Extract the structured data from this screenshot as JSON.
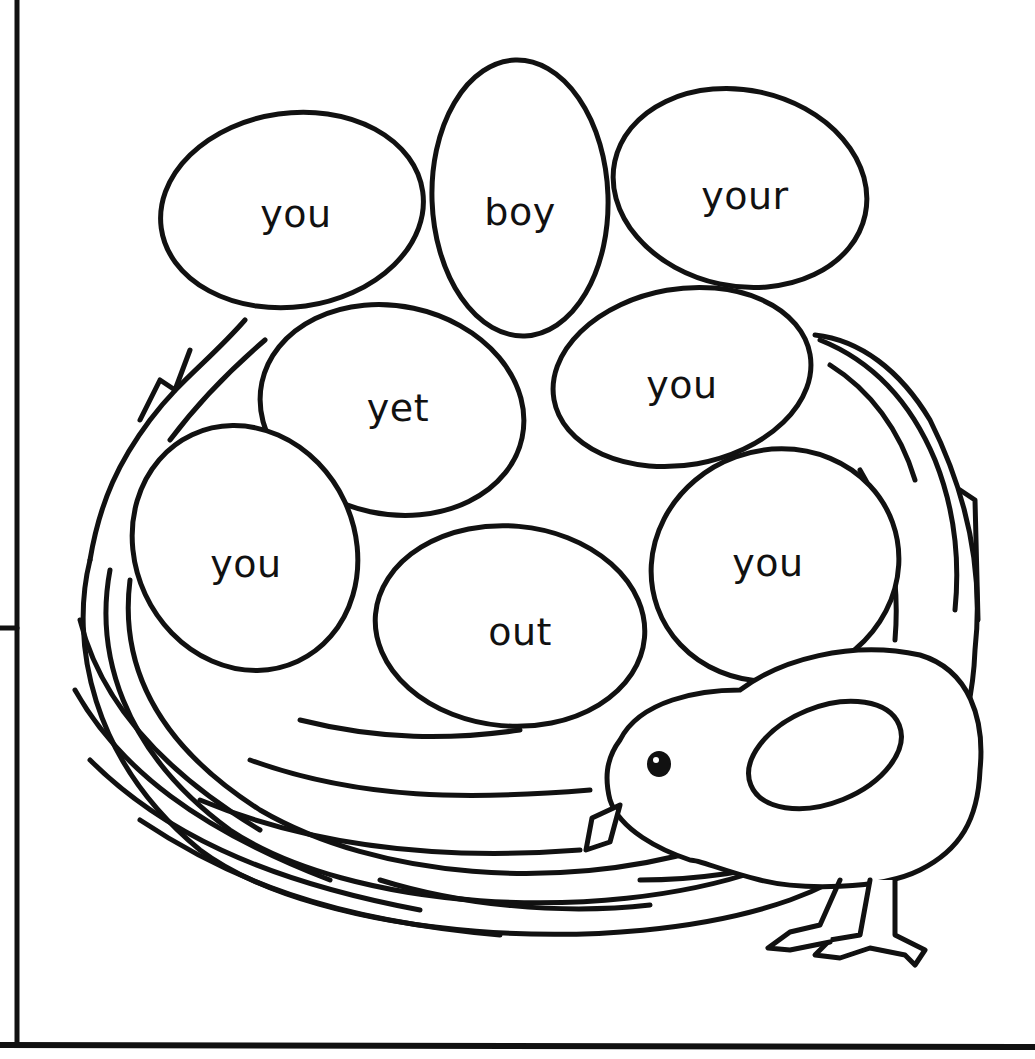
{
  "worksheet": {
    "description": "Coloring worksheet: eggs in a nest with sight words, chick pecking at nest",
    "eggs": [
      {
        "word": "you",
        "cx": 296,
        "cy": 212
      },
      {
        "word": "boy",
        "cx": 520,
        "cy": 212
      },
      {
        "word": "your",
        "cx": 745,
        "cy": 196
      },
      {
        "word": "yet",
        "cx": 398,
        "cy": 408
      },
      {
        "word": "you",
        "cx": 682,
        "cy": 385
      },
      {
        "word": "you",
        "cx": 246,
        "cy": 564
      },
      {
        "word": "out",
        "cx": 520,
        "cy": 632
      },
      {
        "word": "you",
        "cx": 768,
        "cy": 563
      }
    ],
    "colors": {
      "ink": "#111111",
      "paper": "#ffffff"
    }
  }
}
